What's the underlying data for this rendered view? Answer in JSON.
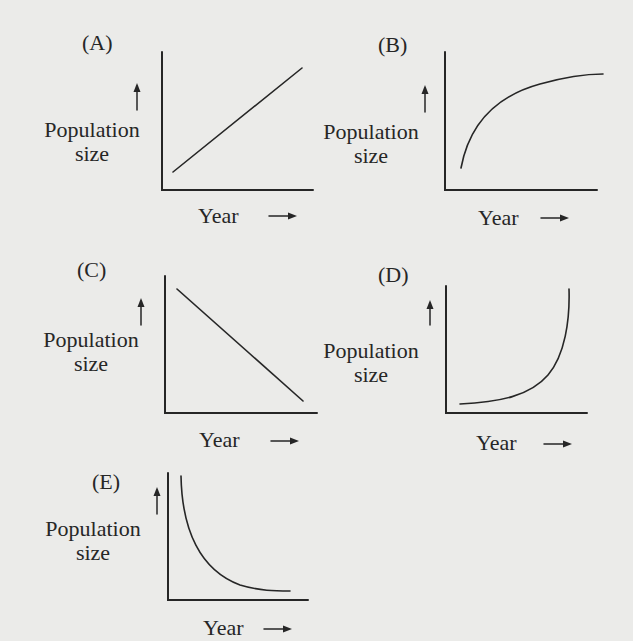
{
  "figure": {
    "axis_labels": {
      "y_line1": "Population",
      "y_line2": "size",
      "x": "Year",
      "x_arrow": "→",
      "y_arrow": "↑"
    },
    "panels": [
      {
        "label": "(A)",
        "shape": "linear increase"
      },
      {
        "label": "(B)",
        "shape": "logarithmic / saturating increase"
      },
      {
        "label": "(C)",
        "shape": "linear decrease"
      },
      {
        "label": "(D)",
        "shape": "exponential increase"
      },
      {
        "label": "(E)",
        "shape": "exponential decay"
      }
    ],
    "colors": {
      "background": "#ebebe9",
      "ink": "#262626"
    }
  }
}
